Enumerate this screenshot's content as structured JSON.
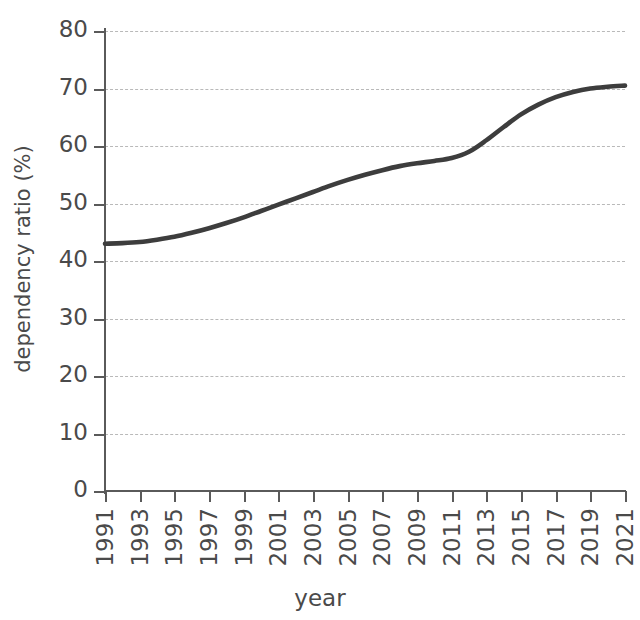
{
  "chart_data": {
    "type": "line",
    "title": "",
    "xlabel": "year",
    "ylabel": "dependency ratio (%)",
    "xlim": [
      1991,
      2021
    ],
    "ylim": [
      0,
      80
    ],
    "grid": true,
    "legend": null,
    "line_color": "#3d3d3d",
    "grid_color": "#b9b9b9",
    "axis_color": "#5a5a5a",
    "y_ticks": [
      0,
      10,
      20,
      30,
      40,
      50,
      60,
      70,
      80
    ],
    "x_ticks": [
      1991,
      1993,
      1995,
      1997,
      1999,
      2001,
      2003,
      2005,
      2007,
      2009,
      2011,
      2013,
      2015,
      2017,
      2019,
      2021
    ],
    "series": [
      {
        "name": "dependency ratio",
        "x": [
          1991,
          1992,
          1993,
          1994,
          1995,
          1996,
          1997,
          1998,
          1999,
          2000,
          2001,
          2002,
          2003,
          2004,
          2005,
          2006,
          2007,
          2008,
          2009,
          2010,
          2011,
          2012,
          2013,
          2014,
          2015,
          2016,
          2017,
          2018,
          2019,
          2020,
          2021
        ],
        "values": [
          43.0,
          43.1,
          43.3,
          43.7,
          44.2,
          44.9,
          45.7,
          46.6,
          47.6,
          48.7,
          49.8,
          50.9,
          52.0,
          53.1,
          54.1,
          55.0,
          55.8,
          56.5,
          57.0,
          57.4,
          57.9,
          59.0,
          61.0,
          63.3,
          65.5,
          67.2,
          68.5,
          69.4,
          70.0,
          70.3,
          70.5
        ]
      }
    ]
  }
}
